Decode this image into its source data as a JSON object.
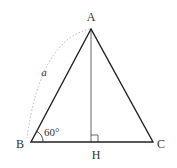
{
  "diagram": {
    "type": "triangle",
    "vertices": {
      "A": {
        "label": "A",
        "x": 91,
        "y": 29
      },
      "B": {
        "label": "B",
        "x": 31,
        "y": 142
      },
      "C": {
        "label": "C",
        "x": 153,
        "y": 142
      },
      "H": {
        "label": "H",
        "x": 91,
        "y": 142
      }
    },
    "labels": {
      "A": "A",
      "B": "B",
      "C": "C",
      "H": "H",
      "side_ab": "a",
      "angle_b": "60°"
    },
    "colors": {
      "triangle_stroke": "#222222",
      "altitude_stroke": "#555555",
      "arc_stroke": "#aaaaaa",
      "text": "#333333"
    }
  }
}
